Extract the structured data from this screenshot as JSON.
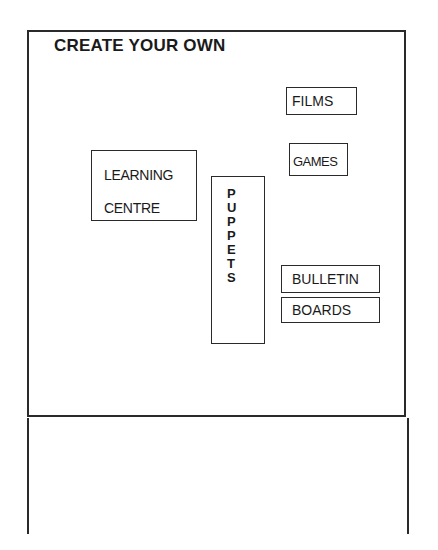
{
  "page": {
    "title": "CREATE YOUR OWN",
    "boxes": {
      "films": "FILMS",
      "games": "GAMES",
      "learning_line1": "LEARNING",
      "learning_line2": "CENTRE",
      "puppets_letters": [
        "P",
        "U",
        "P",
        "P",
        "E",
        "T",
        "S"
      ],
      "bulletin": "BULLETIN",
      "boards": "BOARDS"
    }
  }
}
